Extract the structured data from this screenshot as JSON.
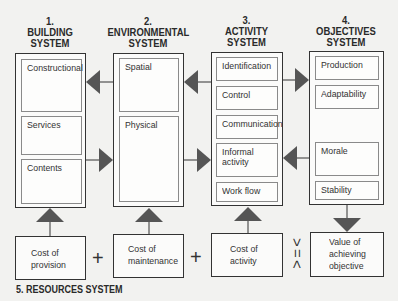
{
  "columns": [
    {
      "number": "1.",
      "title_line1": "BUILDING",
      "title_line2": "SYSTEM",
      "items": [
        "Constructional",
        "Services",
        "Contents"
      ]
    },
    {
      "number": "2.",
      "title_line1": "ENVIRONMENTAL",
      "title_line2": "SYSTEM",
      "items": [
        "Spatial",
        "Physical"
      ]
    },
    {
      "number": "3.",
      "title_line1": "ACTIVITY",
      "title_line2": "SYSTEM",
      "items": [
        "Identification",
        "Control",
        "Communication",
        "Informal",
        "activity",
        "Work flow"
      ]
    },
    {
      "number": "4.",
      "title_line1": "OBJECTIVES",
      "title_line2": "SYSTEM",
      "items": [
        "Production",
        "Adaptability",
        "Morale",
        "Stability"
      ]
    }
  ],
  "resources": {
    "title": "5. RESOURCES  SYSTEM",
    "boxes": [
      {
        "line1": "Cost of",
        "line2": "provision"
      },
      {
        "line1": "Cost of",
        "line2": "maintenance"
      },
      {
        "line1": "Cost of",
        "line2": "activity"
      },
      {
        "line1": "Value of",
        "line2": "achieving",
        "line3": "objective"
      }
    ],
    "operators": {
      "plus1": "+",
      "plus2": "+",
      "compare_top": ">",
      "compare_mid": "=",
      "compare_bot": "<"
    }
  },
  "colors": {
    "arrow": "#555555",
    "border": "#333333"
  }
}
